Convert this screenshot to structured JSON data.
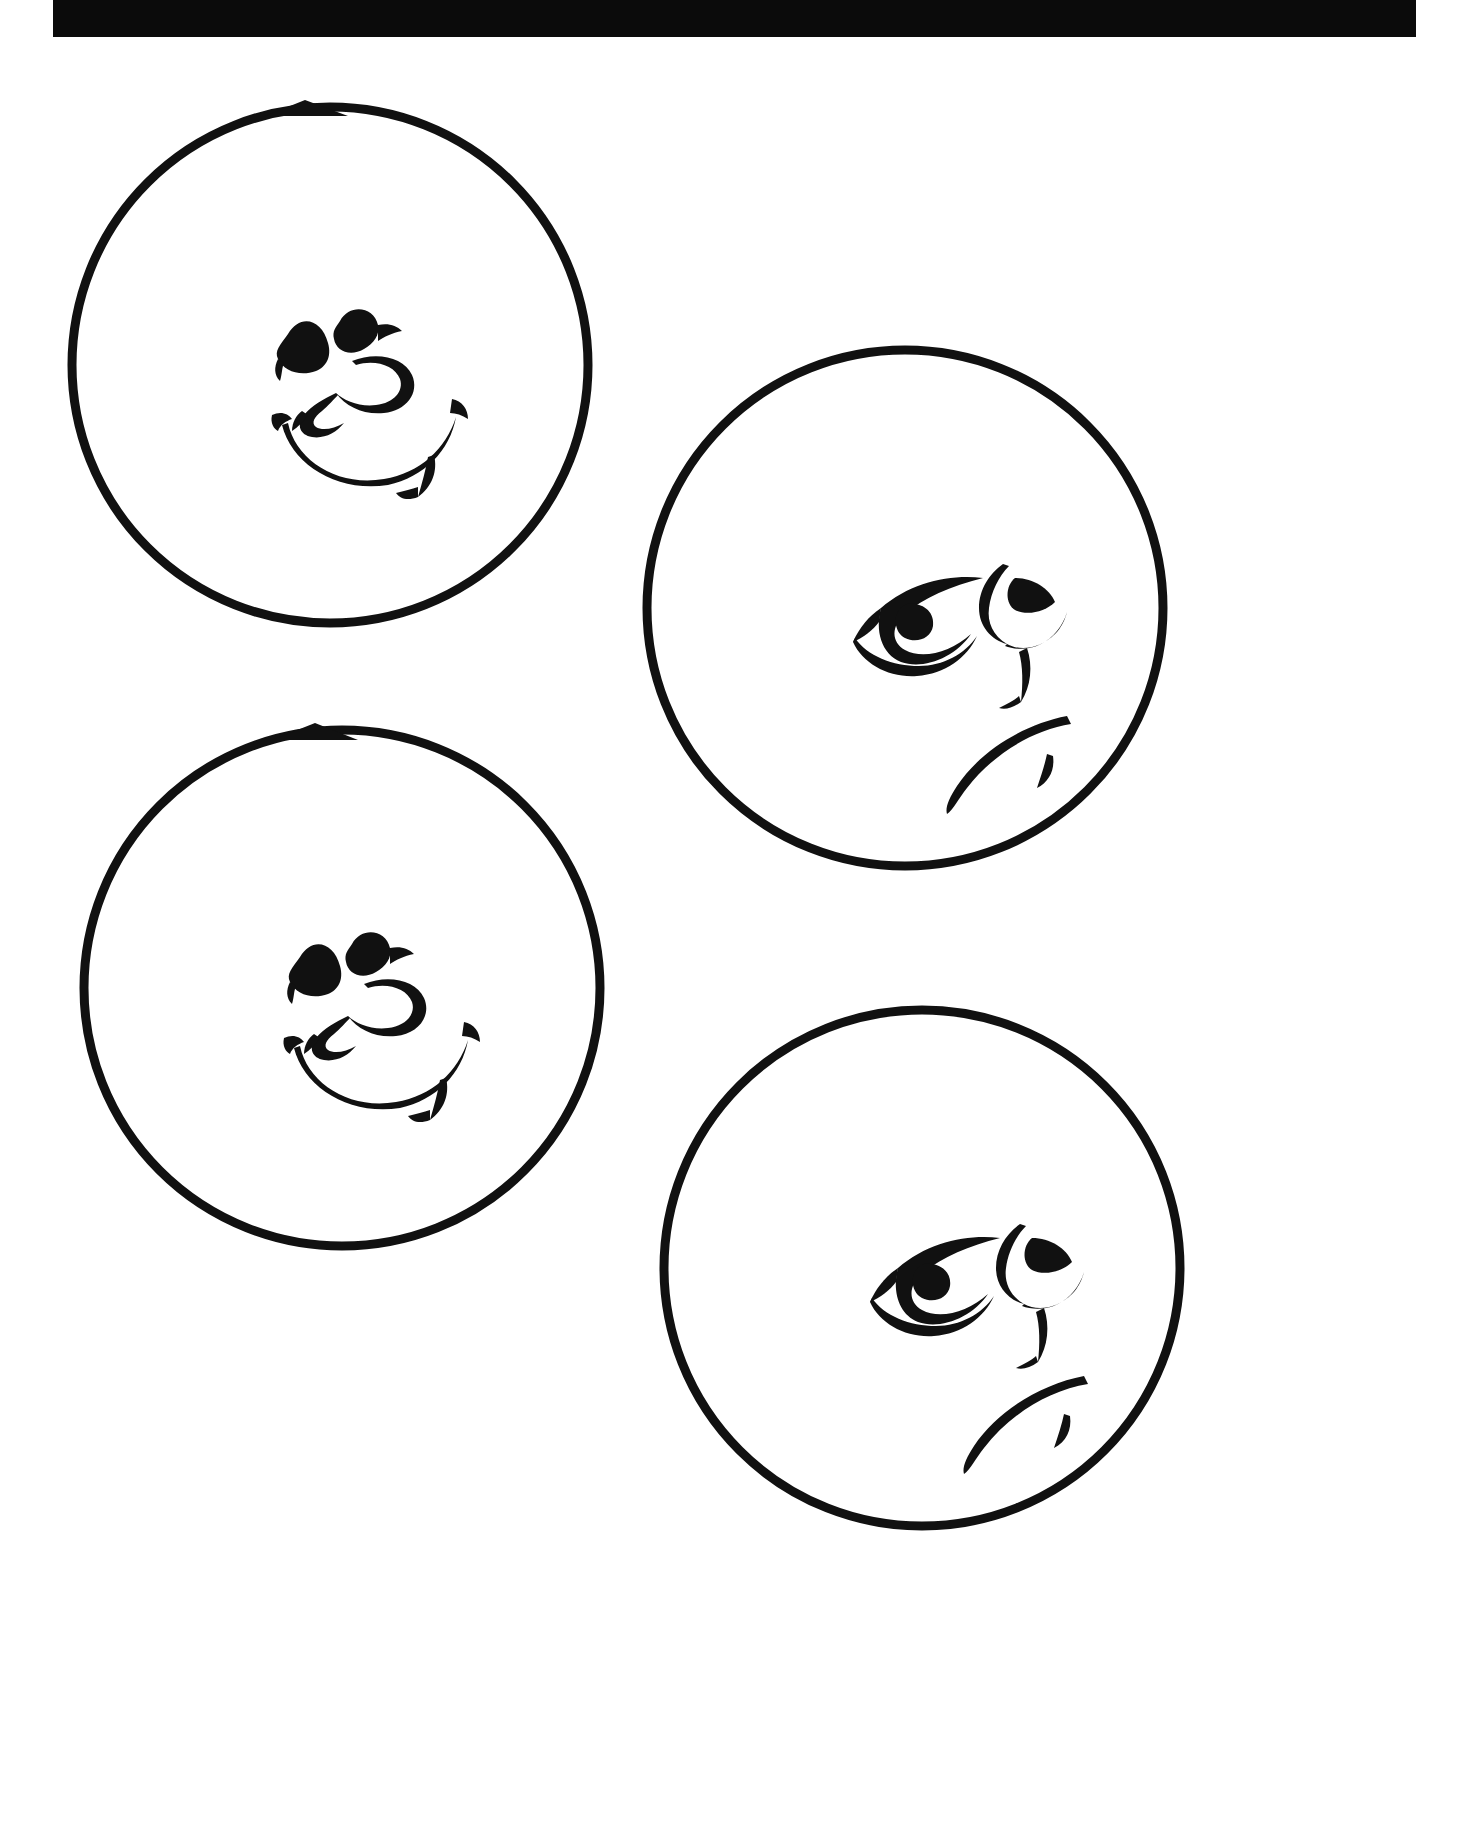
{
  "page": {
    "title": "Smiling and Frowning Face Disc Template Sheet",
    "background_color": "#ffffff",
    "ink_color": "#111111",
    "width": 1469,
    "height": 1839,
    "media": "scanned line-art drawing sheet"
  },
  "artifacts": {
    "top_black_bar": {
      "name": "scanner-black-bar",
      "color": "#0b0b0b",
      "x": 53,
      "y": 0,
      "width": 1363,
      "height": 37
    }
  },
  "figures": [
    {
      "id": "disc-1",
      "label": "Smiling face disc (upper left)",
      "expression": "smiling",
      "center_x": 330,
      "center_y": 365,
      "radius": 258,
      "stroke_width": 9,
      "has_top_notch": true,
      "notch_label": "top alignment triangle",
      "features": [
        "left-eye",
        "right-eye",
        "nose",
        "smile-mouth",
        "left-cheek-tick",
        "right-cheek-tick"
      ]
    },
    {
      "id": "disc-2",
      "label": "Frowning face disc (upper right)",
      "expression": "frowning",
      "center_x": 905,
      "center_y": 608,
      "radius": 258,
      "stroke_width": 9,
      "has_top_notch": false,
      "notch_label": "",
      "features": [
        "left-eye",
        "right-eye",
        "nose",
        "frown-mouth",
        "chin-tick"
      ]
    },
    {
      "id": "disc-3",
      "label": "Smiling face disc (lower left)",
      "expression": "smiling",
      "center_x": 342,
      "center_y": 988,
      "radius": 258,
      "stroke_width": 9,
      "has_top_notch": true,
      "notch_label": "top alignment triangle",
      "features": [
        "left-eye",
        "right-eye",
        "nose",
        "smile-mouth",
        "left-cheek-tick",
        "right-cheek-tick"
      ]
    },
    {
      "id": "disc-4",
      "label": "Frowning face disc (lower right)",
      "expression": "frowning",
      "center_x": 922,
      "center_y": 1268,
      "radius": 258,
      "stroke_width": 9,
      "has_top_notch": false,
      "notch_label": "",
      "features": [
        "left-eye",
        "right-eye",
        "nose",
        "frown-mouth",
        "chin-tick"
      ]
    }
  ],
  "counts": {
    "total_discs": "4",
    "smiling_discs": "2",
    "frowning_discs": "2"
  }
}
